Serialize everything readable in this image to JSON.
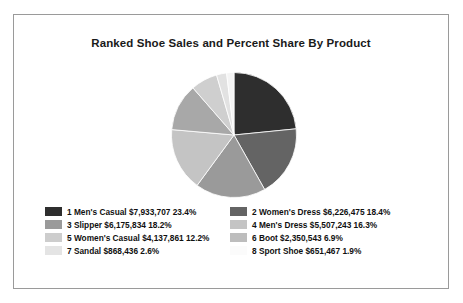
{
  "chart_data": {
    "type": "pie",
    "title": "Ranked Shoe Sales and Percent Share By Product",
    "xlabel": "",
    "ylabel": "",
    "legend_position": "bottom",
    "grid": false,
    "start_angle_deg": 0,
    "direction": "clockwise",
    "categories": [
      "1 Men's Casual",
      "2 Women's Dress",
      "3 Slipper",
      "4 Men's Dress",
      "5 Women's Casual",
      "6 Boot",
      "7 Sandal",
      "8 Sport Shoe"
    ],
    "values": [
      7933707,
      6226475,
      6175834,
      5507243,
      4137861,
      2350543,
      868436,
      651467
    ],
    "percents": [
      23.4,
      18.4,
      18.2,
      16.3,
      12.2,
      6.9,
      2.6,
      1.9
    ],
    "colors": [
      "#2e2e2e",
      "#646464",
      "#9a9a9a",
      "#c4c4c4",
      "#a8a8a8",
      "#cfcfcf",
      "#e2e2e2",
      "#f4f4f4"
    ],
    "slices": [
      {
        "rank": "1",
        "name": "Men's Casual",
        "value_label": "$7,933,707",
        "percent_label": "23.4%",
        "color": "#2e2e2e"
      },
      {
        "rank": "2",
        "name": "Women's Dress",
        "value_label": "$6,226,475",
        "percent_label": "18.4%",
        "color": "#646464"
      },
      {
        "rank": "3",
        "name": "Slipper",
        "value_label": "$6,175,834",
        "percent_label": "18.2%",
        "color": "#9a9a9a"
      },
      {
        "rank": "4",
        "name": "Men's Dress",
        "value_label": "$5,507,243",
        "percent_label": "16.3%",
        "color": "#c4c4c4"
      },
      {
        "rank": "5",
        "name": "Women's Casual",
        "value_label": "$4,137,861",
        "percent_label": "12.2%",
        "color": "#a8a8a8"
      },
      {
        "rank": "6",
        "name": "Boot",
        "value_label": "$2,350,543",
        "percent_label": "6.9%",
        "color": "#cfcfcf"
      },
      {
        "rank": "7",
        "name": "Sandal",
        "value_label": "$868,436",
        "percent_label": "2.6%",
        "color": "#e2e2e2"
      },
      {
        "rank": "8",
        "name": "Sport Shoe",
        "value_label": "$651,467",
        "percent_label": "1.9%",
        "color": "#f4f4f4"
      }
    ]
  },
  "legend": {
    "items": [
      {
        "label": "1 Men's Casual $7,933,707 23.4%",
        "color": "#2e2e2e"
      },
      {
        "label": "2 Women's Dress $6,226,475 18.4%",
        "color": "#646464"
      },
      {
        "label": "3 Slipper $6,175,834 18.2%",
        "color": "#9a9a9a"
      },
      {
        "label": "4 Men's Dress $5,507,243 16.3%",
        "color": "#c4c4c4"
      },
      {
        "label": "5 Women's Casual $4,137,861 12.2%",
        "color": "#cdcdcd"
      },
      {
        "label": "6 Boot $2,350,543 6.9%",
        "color": "#bdbdbd"
      },
      {
        "label": "7 Sandal $868,436 2.6%",
        "color": "#e4e4e4"
      },
      {
        "label": "8 Sport Shoe $651,467 1.9%",
        "color": "#fbfbfb"
      }
    ]
  },
  "frame": {
    "border_color": "#9a9a9a",
    "background": "#ffffff"
  }
}
